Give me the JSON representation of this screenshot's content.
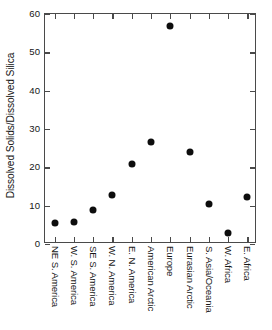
{
  "chart_data": {
    "type": "scatter",
    "title": "",
    "xlabel": "",
    "ylabel": "Dissolved Solids/Dissolved Silica",
    "categories": [
      "NE S. America",
      "W. S. America",
      "SE S. America",
      "W. N. America",
      "E. N. America",
      "American Arctic",
      "Europe",
      "Eurasian Arctic",
      "S. Asia/Oceania",
      "W. Africa",
      "E. Africa"
    ],
    "values": [
      5.4,
      5.7,
      8.9,
      12.8,
      21.0,
      26.5,
      56.8,
      23.9,
      10.4,
      2.8,
      12.2
    ],
    "ylim": [
      0,
      60
    ],
    "yticks": [
      0,
      10,
      20,
      30,
      40,
      50,
      60
    ],
    "ytick_labels": [
      "0",
      "10",
      "20",
      "30",
      "40",
      "50",
      "60"
    ],
    "grid": false,
    "legend": null,
    "marker": "filled-circle",
    "marker_color": "#0d0d0d",
    "axis_color": "#4a4a4a",
    "background": "#ffffff"
  }
}
